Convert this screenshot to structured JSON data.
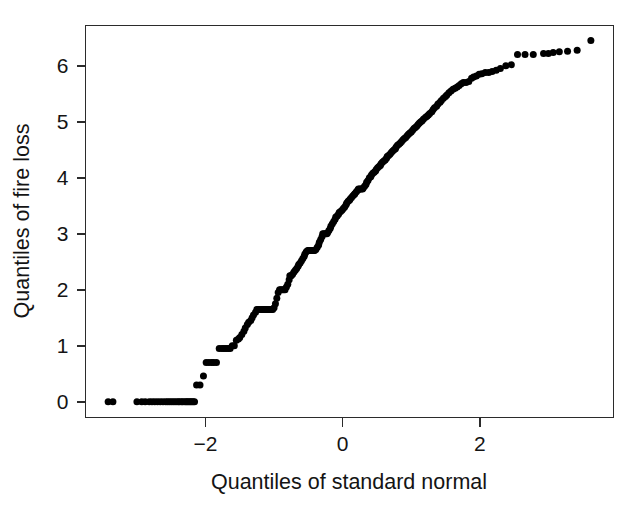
{
  "chart_data": {
    "type": "scatter",
    "title": "",
    "subtitle": "",
    "xlabel": "Quantiles of standard normal",
    "ylabel": "Quantiles of fire loss",
    "xlim": [
      -3.75,
      3.95
    ],
    "ylim": [
      -0.28,
      6.72
    ],
    "xticks": [
      -2,
      0,
      2
    ],
    "xticklabels": [
      "−2",
      "0",
      "2"
    ],
    "yticks": [
      0,
      1,
      2,
      3,
      4,
      5,
      6
    ],
    "yticklabels": [
      "0",
      "1",
      "2",
      "3",
      "4",
      "5",
      "6"
    ],
    "grid": false,
    "legend": null,
    "marker": "filled-circle",
    "marker_color": "#000000",
    "marker_size_px": 7,
    "point_count": 221,
    "annotations": [],
    "x": [
      -3.42,
      -3.35,
      -3.0,
      -2.93,
      -2.88,
      -2.82,
      -2.78,
      -2.74,
      -2.7,
      -2.66,
      -2.62,
      -2.58,
      -2.55,
      -2.52,
      -2.49,
      -2.46,
      -2.43,
      -2.4,
      -2.38,
      -2.35,
      -2.33,
      -2.3,
      -2.28,
      -2.26,
      -2.24,
      -2.22,
      -2.2,
      -2.18,
      -2.16,
      -2.13,
      -2.08,
      -2.03,
      -1.99,
      -1.95,
      -1.91,
      -1.88,
      -1.84,
      -1.8,
      -1.76,
      -1.73,
      -1.7,
      -1.67,
      -1.64,
      -1.61,
      -1.58,
      -1.55,
      -1.52,
      -1.5,
      -1.47,
      -1.44,
      -1.42,
      -1.39,
      -1.37,
      -1.34,
      -1.32,
      -1.3,
      -1.27,
      -1.25,
      -1.23,
      -1.21,
      -1.18,
      -1.16,
      -1.14,
      -1.12,
      -1.1,
      -1.08,
      -1.06,
      -1.04,
      -1.02,
      -1.0,
      -0.98,
      -0.96,
      -0.94,
      -0.92,
      -0.9,
      -0.88,
      -0.86,
      -0.84,
      -0.82,
      -0.8,
      -0.78,
      -0.77,
      -0.75,
      -0.73,
      -0.71,
      -0.69,
      -0.67,
      -0.65,
      -0.64,
      -0.62,
      -0.6,
      -0.58,
      -0.56,
      -0.55,
      -0.53,
      -0.51,
      -0.49,
      -0.48,
      -0.46,
      -0.44,
      -0.42,
      -0.41,
      -0.39,
      -0.37,
      -0.35,
      -0.34,
      -0.32,
      -0.3,
      -0.29,
      -0.27,
      -0.25,
      -0.23,
      -0.22,
      -0.2,
      -0.18,
      -0.17,
      -0.15,
      -0.13,
      -0.11,
      -0.1,
      -0.08,
      -0.06,
      -0.05,
      -0.03,
      -0.01,
      0.01,
      0.03,
      0.05,
      0.06,
      0.08,
      0.1,
      0.11,
      0.13,
      0.15,
      0.17,
      0.18,
      0.2,
      0.22,
      0.23,
      0.25,
      0.27,
      0.29,
      0.3,
      0.32,
      0.34,
      0.35,
      0.37,
      0.39,
      0.41,
      0.42,
      0.44,
      0.46,
      0.48,
      0.49,
      0.51,
      0.53,
      0.55,
      0.56,
      0.58,
      0.6,
      0.62,
      0.64,
      0.65,
      0.67,
      0.69,
      0.71,
      0.73,
      0.75,
      0.77,
      0.78,
      0.8,
      0.82,
      0.84,
      0.86,
      0.88,
      0.9,
      0.92,
      0.94,
      0.96,
      0.98,
      1.0,
      1.02,
      1.04,
      1.06,
      1.08,
      1.1,
      1.12,
      1.14,
      1.16,
      1.18,
      1.21,
      1.23,
      1.25,
      1.27,
      1.3,
      1.32,
      1.34,
      1.37,
      1.39,
      1.42,
      1.44,
      1.47,
      1.5,
      1.52,
      1.55,
      1.58,
      1.61,
      1.64,
      1.67,
      1.7,
      1.73,
      1.76,
      1.8,
      1.84,
      1.88,
      1.91,
      1.95,
      1.99,
      2.03,
      2.08,
      2.13,
      2.18,
      2.24,
      2.3,
      2.38,
      2.46,
      2.55,
      2.66,
      2.78,
      2.93,
      3.0,
      3.07,
      3.16,
      3.28,
      3.42,
      3.62
    ],
    "y": [
      0.0,
      0.0,
      0.0,
      0.0,
      0.0,
      0.0,
      0.0,
      0.0,
      0.0,
      0.0,
      0.0,
      0.0,
      0.0,
      0.0,
      0.0,
      0.0,
      0.0,
      0.0,
      0.0,
      0.0,
      0.0,
      0.0,
      0.0,
      0.0,
      0.0,
      0.0,
      0.0,
      0.0,
      0.0,
      0.3,
      0.3,
      0.46,
      0.7,
      0.7,
      0.7,
      0.7,
      0.7,
      0.95,
      0.95,
      0.95,
      0.95,
      0.95,
      0.95,
      1.0,
      1.0,
      1.1,
      1.12,
      1.15,
      1.2,
      1.26,
      1.32,
      1.38,
      1.42,
      1.45,
      1.5,
      1.55,
      1.6,
      1.65,
      1.65,
      1.65,
      1.65,
      1.65,
      1.65,
      1.65,
      1.65,
      1.65,
      1.65,
      1.65,
      1.65,
      1.68,
      1.75,
      1.85,
      1.95,
      2.0,
      2.0,
      2.0,
      2.0,
      2.0,
      2.05,
      2.1,
      2.18,
      2.25,
      2.25,
      2.28,
      2.32,
      2.35,
      2.38,
      2.42,
      2.45,
      2.48,
      2.52,
      2.56,
      2.6,
      2.64,
      2.68,
      2.7,
      2.7,
      2.7,
      2.7,
      2.7,
      2.7,
      2.7,
      2.72,
      2.76,
      2.8,
      2.85,
      2.9,
      2.95,
      3.0,
      3.0,
      3.0,
      3.0,
      3.02,
      3.06,
      3.1,
      3.14,
      3.18,
      3.22,
      3.26,
      3.3,
      3.32,
      3.35,
      3.38,
      3.4,
      3.42,
      3.45,
      3.48,
      3.52,
      3.55,
      3.58,
      3.6,
      3.62,
      3.65,
      3.68,
      3.7,
      3.72,
      3.75,
      3.78,
      3.8,
      3.8,
      3.8,
      3.8,
      3.82,
      3.85,
      3.88,
      3.92,
      3.95,
      4.0,
      4.02,
      4.05,
      4.08,
      4.1,
      4.12,
      4.15,
      4.18,
      4.2,
      4.22,
      4.25,
      4.28,
      4.3,
      4.32,
      4.35,
      4.38,
      4.4,
      4.42,
      4.45,
      4.48,
      4.5,
      4.52,
      4.55,
      4.58,
      4.6,
      4.62,
      4.65,
      4.68,
      4.7,
      4.72,
      4.75,
      4.78,
      4.8,
      4.82,
      4.85,
      4.88,
      4.9,
      4.92,
      4.95,
      4.98,
      5.0,
      5.02,
      5.05,
      5.08,
      5.1,
      5.12,
      5.15,
      5.18,
      5.22,
      5.25,
      5.28,
      5.32,
      5.35,
      5.38,
      5.42,
      5.45,
      5.48,
      5.52,
      5.55,
      5.58,
      5.6,
      5.62,
      5.65,
      5.68,
      5.7,
      5.7,
      5.72,
      5.78,
      5.8,
      5.82,
      5.85,
      5.86,
      5.88,
      5.88,
      5.9,
      5.92,
      5.95,
      6.0,
      6.02,
      6.2,
      6.2,
      6.2,
      6.22,
      6.22,
      6.24,
      6.25,
      6.26,
      6.28,
      6.45
    ]
  },
  "axes": {
    "x_title": "Quantiles of standard normal",
    "y_title": "Quantiles of fire loss"
  }
}
